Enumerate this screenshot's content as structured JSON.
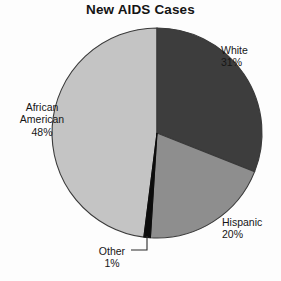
{
  "chart_data": {
    "type": "pie",
    "title": "New AIDS Cases",
    "categories": [
      "White",
      "Hispanic",
      "Other",
      "African American"
    ],
    "values": [
      31,
      20,
      1,
      48
    ],
    "value_unit": "%",
    "labels": [
      {
        "name": "White",
        "value": 31,
        "value_text": "31%",
        "color": "#3d3d3d",
        "position": "upper-right",
        "leader": false
      },
      {
        "name": "Hispanic",
        "value": 20,
        "value_text": "20%",
        "color": "#8e8e8e",
        "position": "lower-right",
        "leader": false
      },
      {
        "name": "Other",
        "value": 1,
        "value_text": "1%",
        "color": "#0c0c0c",
        "position": "bottom",
        "leader": true
      },
      {
        "name": "African American",
        "value": 48,
        "value_text": "48%",
        "color": "#c4c4c4",
        "position": "left",
        "leader": false
      }
    ],
    "start_angle_deg": 0,
    "direction": "clockwise",
    "legend": "none",
    "grid": false,
    "background": "#fdfdfd",
    "outline_color": "#3a3a3a"
  },
  "chart": {
    "title": "New AIDS Cases",
    "white": {
      "name": "White",
      "pct": "31%"
    },
    "african_american": {
      "name_line1": "African",
      "name_line2": "American",
      "pct": "48%"
    },
    "hispanic": {
      "name": "Hispanic",
      "pct": "20%"
    },
    "other": {
      "name": "Other",
      "pct": "1%"
    }
  }
}
